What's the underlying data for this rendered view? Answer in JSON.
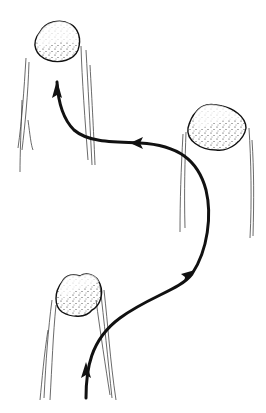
{
  "diagram": {
    "colors": {
      "background": "#ffffff",
      "ink": "#111111",
      "faint": "#777777"
    },
    "nodes": [
      {
        "id": "pillar-top",
        "label": "",
        "cx": 57,
        "cy": 40
      },
      {
        "id": "pillar-middle",
        "label": "",
        "cx": 218,
        "cy": 116
      },
      {
        "id": "pillar-bottom",
        "label": "",
        "cx": 77,
        "cy": 293
      }
    ],
    "path": {
      "direction": "bottom-to-top",
      "arrowheads": 4
    }
  }
}
